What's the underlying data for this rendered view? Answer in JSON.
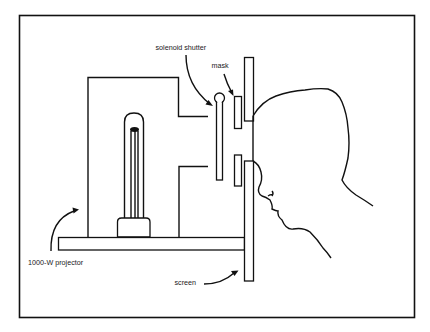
{
  "diagram": {
    "type": "apparatus-schematic",
    "labels": {
      "solenoid_shutter": "solenoid shutter",
      "mask": "mask",
      "projector": "1000-W projector",
      "screen": "screen"
    },
    "components": [
      {
        "id": "projector",
        "label": "1000-W projector"
      },
      {
        "id": "lamp",
        "label": ""
      },
      {
        "id": "solenoid_shutter",
        "label": "solenoid shutter"
      },
      {
        "id": "mask",
        "label": "mask"
      },
      {
        "id": "screen",
        "label": "screen"
      },
      {
        "id": "viewer_head",
        "label": ""
      },
      {
        "id": "base_plate",
        "label": ""
      }
    ],
    "colors": {
      "line": "#111111",
      "background": "#ffffff"
    }
  }
}
